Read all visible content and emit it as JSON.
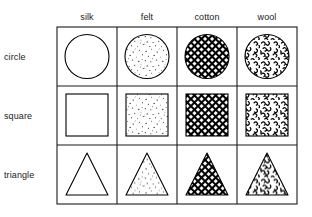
{
  "figure": {
    "caption": "",
    "columns": [
      {
        "key": "silk",
        "label": "silk",
        "pattern": "blank"
      },
      {
        "key": "felt",
        "label": "felt",
        "pattern": "stipple-dots"
      },
      {
        "key": "cotton",
        "label": "cotton",
        "pattern": "crosshatch-mesh"
      },
      {
        "key": "wool",
        "label": "wool",
        "pattern": "curl-texture"
      }
    ],
    "rows": [
      {
        "key": "circle",
        "label": "circle",
        "shape": "circle"
      },
      {
        "key": "square",
        "label": "square",
        "shape": "square"
      },
      {
        "key": "triangle",
        "label": "triangle",
        "shape": "triangle"
      }
    ],
    "cells": [
      [
        {
          "shape": "circle",
          "material": "silk",
          "fill": "blank"
        },
        {
          "shape": "circle",
          "material": "felt",
          "fill": "stipple-dots"
        },
        {
          "shape": "circle",
          "material": "cotton",
          "fill": "crosshatch-mesh"
        },
        {
          "shape": "circle",
          "material": "wool",
          "fill": "curl-texture"
        }
      ],
      [
        {
          "shape": "square",
          "material": "silk",
          "fill": "blank"
        },
        {
          "shape": "square",
          "material": "felt",
          "fill": "stipple-dots"
        },
        {
          "shape": "square",
          "material": "cotton",
          "fill": "crosshatch-mesh"
        },
        {
          "shape": "square",
          "material": "wool",
          "fill": "curl-texture"
        }
      ],
      [
        {
          "shape": "triangle",
          "material": "silk",
          "fill": "blank"
        },
        {
          "shape": "triangle",
          "material": "felt",
          "fill": "stipple-dots"
        },
        {
          "shape": "triangle",
          "material": "cotton",
          "fill": "crosshatch-mesh"
        },
        {
          "shape": "triangle",
          "material": "wool",
          "fill": "curl-texture"
        }
      ]
    ],
    "colors": {
      "background": "#ffffff",
      "grid_line": "#1a1a1a",
      "shape_outline": "#000000",
      "pattern_ink": "#000000",
      "text": "#1a1a1a"
    },
    "geometry": {
      "grid_left": 57,
      "grid_top": 27,
      "grid_right": 297,
      "grid_bottom": 204,
      "column_edges": [
        57,
        117,
        177,
        237,
        297
      ],
      "row_edges": [
        27,
        86,
        145,
        204
      ]
    }
  }
}
